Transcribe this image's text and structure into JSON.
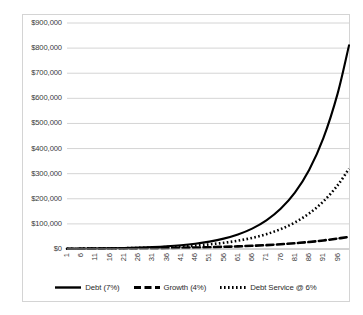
{
  "chart_data": {
    "type": "line",
    "title": "",
    "xlabel": "",
    "ylabel": "",
    "xlim": [
      1,
      100
    ],
    "ylim": [
      0,
      900000
    ],
    "grid": true,
    "legend_position": "bottom",
    "y_ticks": [
      "$900,000",
      "$800,000",
      "$700,000",
      "$600,000",
      "$500,000",
      "$400,000",
      "$300,000",
      "$200,000",
      "$100,000",
      "$0"
    ],
    "y_tick_values": [
      900000,
      800000,
      700000,
      600000,
      500000,
      400000,
      300000,
      200000,
      100000,
      0
    ],
    "x_ticks": [
      "1",
      "6",
      "11",
      "16",
      "21",
      "26",
      "31",
      "36",
      "41",
      "46",
      "51",
      "56",
      "61",
      "66",
      "71",
      "76",
      "81",
      "86",
      "91",
      "96"
    ],
    "x_tick_values": [
      1,
      6,
      11,
      16,
      21,
      26,
      31,
      36,
      41,
      46,
      51,
      56,
      61,
      66,
      71,
      76,
      81,
      86,
      91,
      96
    ],
    "series": [
      {
        "name": "Debt (7%)",
        "style": "solid",
        "color": "#000000",
        "x": [
          1,
          6,
          11,
          16,
          21,
          26,
          31,
          36,
          41,
          46,
          51,
          56,
          61,
          66,
          71,
          76,
          81,
          86,
          91,
          96,
          100
        ],
        "values": [
          1000,
          1403,
          1967,
          2759,
          3870,
          5427,
          7612,
          10677,
          14974,
          21002,
          29457,
          41315,
          57946,
          81273,
          113989,
          159876,
          224234,
          314500,
          441113,
          618670,
          810900
        ]
      },
      {
        "name": "Growth (4%)",
        "style": "dashed",
        "color": "#000000",
        "x": [
          1,
          6,
          11,
          16,
          21,
          26,
          31,
          36,
          41,
          46,
          51,
          56,
          61,
          66,
          71,
          76,
          81,
          86,
          91,
          96,
          100
        ],
        "values": [
          1000,
          1217,
          1480,
          1801,
          2191,
          2666,
          3243,
          3946,
          4801,
          5841,
          7107,
          8646,
          10520,
          12799,
          15572,
          18945,
          23050,
          28044,
          34119,
          41510,
          48563
        ]
      },
      {
        "name": "Debt Service @ 6%",
        "style": "dotted",
        "color": "#000000",
        "x": [
          1,
          6,
          11,
          16,
          21,
          26,
          31,
          36,
          41,
          46,
          51,
          56,
          61,
          66,
          71,
          76,
          81,
          86,
          91,
          96,
          100
        ],
        "values": [
          1000,
          1338,
          1791,
          2397,
          3207,
          4292,
          5744,
          7686,
          10286,
          13765,
          18420,
          24650,
          32988,
          44145,
          59076,
          79057,
          105796,
          141579,
          189465,
          253546,
          319950
        ]
      }
    ]
  },
  "legend": {
    "entries": [
      {
        "label": "Debt (7%)",
        "style": "solid"
      },
      {
        "label": "Growth (4%)",
        "style": "dashed"
      },
      {
        "label": "Debt Service @ 6%",
        "style": "dotted"
      }
    ]
  }
}
